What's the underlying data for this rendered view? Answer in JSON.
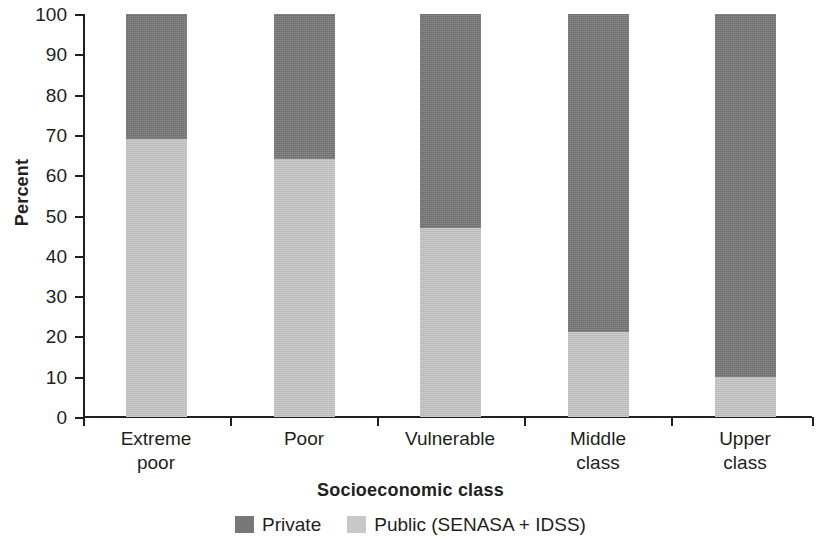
{
  "chart_data": {
    "type": "bar",
    "subtype": "stacked-bar-100",
    "title": "",
    "xlabel": "Socioeconomic class",
    "ylabel": "Percent",
    "categories": [
      "Extreme poor",
      "Poor",
      "Vulnerable",
      "Middle class",
      "Upper class"
    ],
    "category_lines": [
      [
        "Extreme",
        "poor"
      ],
      [
        "Poor"
      ],
      [
        "Vulnerable"
      ],
      [
        "Middle",
        "class"
      ],
      [
        "Upper",
        "class"
      ]
    ],
    "series": [
      {
        "name": "Private",
        "color": "#787878",
        "values": [
          31,
          36,
          53,
          79,
          90
        ]
      },
      {
        "name": "Public (SENASA + IDSS)",
        "color": "#c8c8c8",
        "values": [
          69,
          64,
          47,
          21,
          10
        ]
      }
    ],
    "stack_order": [
      "Public (SENASA + IDSS)",
      "Private"
    ],
    "ylim": [
      0,
      100
    ],
    "y_ticks": [
      0,
      10,
      20,
      30,
      40,
      50,
      60,
      70,
      80,
      90,
      100
    ],
    "y_tick_labels": [
      "0",
      "10",
      "20",
      "30",
      "40",
      "50",
      "60",
      "70",
      "80",
      "90",
      "100"
    ],
    "grid": false,
    "legend_position": "bottom-center",
    "legend_entries": [
      {
        "label": "Private",
        "color": "#787878"
      },
      {
        "label": "Public (SENASA + IDSS)",
        "color": "#c8c8c8"
      }
    ]
  },
  "axes": {
    "y_title": "Percent",
    "x_title": "Socioeconomic class"
  },
  "colors": {
    "private": "#787878",
    "public": "#c8c8c8",
    "axis": "#231f20",
    "text": "#231f20",
    "background": "#ffffff"
  }
}
